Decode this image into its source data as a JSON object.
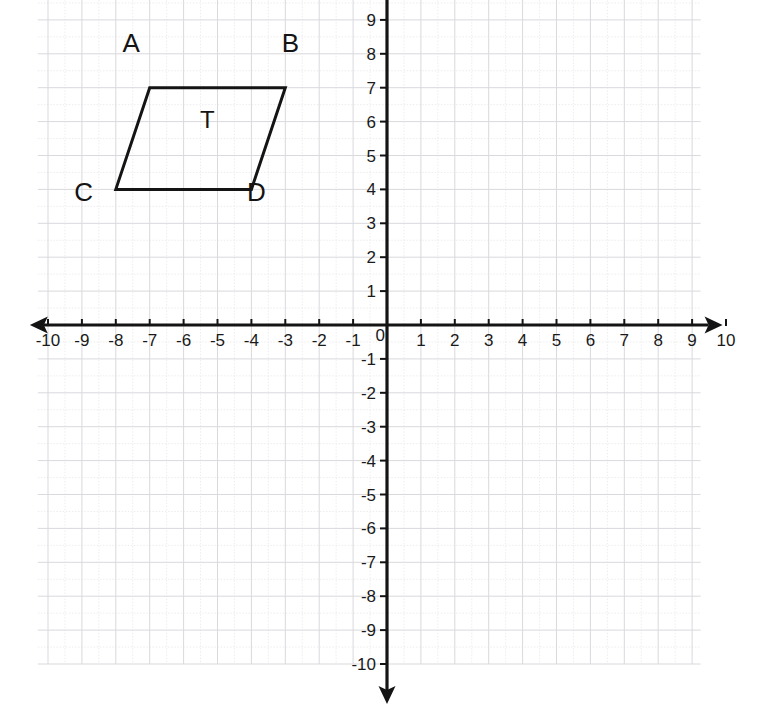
{
  "chart_data": {
    "type": "scatter",
    "title": "",
    "subtitle": "",
    "xlabel": "",
    "ylabel": "",
    "xlim": [
      -10,
      10
    ],
    "ylim": [
      -10,
      10
    ],
    "grid": true,
    "legend_position": "none",
    "x_tick_labels": [
      "-10",
      "-9",
      "-8",
      "-7",
      "-6",
      "-5",
      "-4",
      "-3",
      "-2",
      "-1",
      "0",
      "1",
      "2",
      "3",
      "4",
      "5",
      "6",
      "7",
      "8",
      "9",
      "10"
    ],
    "x_tick_values": [
      -10,
      -9,
      -8,
      -7,
      -6,
      -5,
      -4,
      -3,
      -2,
      -1,
      0,
      1,
      2,
      3,
      4,
      5,
      6,
      7,
      8,
      9,
      10
    ],
    "y_tick_labels": [
      "10",
      "9",
      "8",
      "7",
      "6",
      "5",
      "4",
      "3",
      "2",
      "1",
      "-1",
      "-2",
      "-3",
      "-4",
      "-5",
      "-6",
      "-7",
      "-8",
      "-9",
      "-10"
    ],
    "y_tick_values": [
      10,
      9,
      8,
      7,
      6,
      5,
      4,
      3,
      2,
      1,
      -1,
      -2,
      -3,
      -4,
      -5,
      -6,
      -7,
      -8,
      -9,
      -10
    ],
    "origin_label": "0",
    "annotations": [
      {
        "label": "T",
        "x": -5.3,
        "y": 5.8,
        "kind": "shape-interior-label"
      }
    ],
    "shapes": [
      {
        "name": "T",
        "kind": "parallelogram",
        "closed": true,
        "stroke": "#141414",
        "fill": "none",
        "vertices": [
          {
            "label": "A",
            "x": -7,
            "y": 7,
            "label_dx": -0.55,
            "label_dy": 1.05
          },
          {
            "label": "B",
            "x": -3,
            "y": 7,
            "label_dx": 0.15,
            "label_dy": 1.05
          },
          {
            "label": "D",
            "x": -4,
            "y": 4,
            "label_dx": 0.15,
            "label_dy": -0.35
          },
          {
            "label": "C",
            "x": -8,
            "y": 4,
            "label_dx": -0.95,
            "label_dy": -0.35
          }
        ]
      }
    ]
  },
  "axes": {
    "x_axis_name": "x-axis",
    "y_axis_name": "y-axis",
    "arrow_left": true,
    "arrow_right": true,
    "arrow_up": true,
    "arrow_down": true
  },
  "colors": {
    "grid_minor": "#e9e9ec",
    "grid_major": "#d9d9de",
    "axis": "#141414",
    "shape_stroke": "#141414",
    "text": "#1a1a1a",
    "background": "#ffffff"
  }
}
